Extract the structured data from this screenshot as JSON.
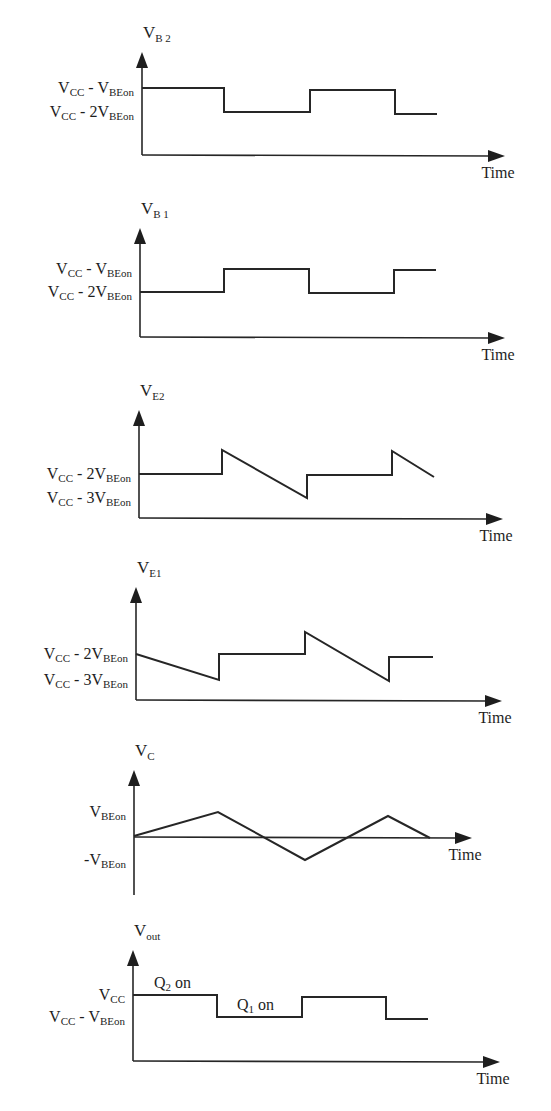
{
  "figure": {
    "background": "#ffffff",
    "ink": "#262626",
    "time_label": "Time"
  },
  "chart_data": {
    "type": "line",
    "panels": [
      {
        "id": "vb2",
        "title": {
          "main": "V",
          "sub": "B 2"
        },
        "xlabel": "Time",
        "y_ticks": [
          {
            "main": "V",
            "sub1": "CC",
            "mid": " - V",
            "sub2": "BEon",
            "y": 88
          },
          {
            "main": "V",
            "sub1": "CC",
            "mid": " - 2V",
            "sub2": "BEon",
            "y": 112
          }
        ],
        "axis": {
          "x0": 142,
          "ytop": 52,
          "ybase": 155,
          "xend": 505
        },
        "points": [
          [
            142,
            88
          ],
          [
            224,
            88
          ],
          [
            224,
            112
          ],
          [
            310,
            112
          ],
          [
            310,
            90
          ],
          [
            395,
            90
          ],
          [
            395,
            114
          ],
          [
            437,
            114
          ]
        ]
      },
      {
        "id": "vb1",
        "title": {
          "main": "V",
          "sub": "B 1"
        },
        "xlabel": "Time",
        "y_ticks": [
          {
            "main": "V",
            "sub1": "CC",
            "mid": " - V",
            "sub2": "BEon",
            "y": 269
          },
          {
            "main": "V",
            "sub1": "CC",
            "mid": " - 2V",
            "sub2": "BEon",
            "y": 292
          }
        ],
        "axis": {
          "x0": 140,
          "ytop": 228,
          "ybase": 337,
          "xend": 505
        },
        "points": [
          [
            140,
            292
          ],
          [
            224,
            292
          ],
          [
            224,
            269
          ],
          [
            309,
            269
          ],
          [
            309,
            293
          ],
          [
            394,
            293
          ],
          [
            394,
            270
          ],
          [
            436,
            270
          ]
        ]
      },
      {
        "id": "ve2",
        "title": {
          "main": "V",
          "sub": "E2"
        },
        "xlabel": "Time",
        "y_ticks": [
          {
            "main": "V",
            "sub1": "CC",
            "mid": " - 2V",
            "sub2": "BEon",
            "y": 474
          },
          {
            "main": "V",
            "sub1": "CC",
            "mid": " - 3V",
            "sub2": "BEon",
            "y": 498
          }
        ],
        "axis": {
          "x0": 139,
          "ytop": 410,
          "ybase": 518,
          "xend": 503
        },
        "points": [
          [
            139,
            474
          ],
          [
            222,
            474
          ],
          [
            222,
            450
          ],
          [
            307,
            498
          ],
          [
            307,
            475
          ],
          [
            392,
            475
          ],
          [
            392,
            451
          ],
          [
            434,
            477
          ]
        ]
      },
      {
        "id": "ve1",
        "title": {
          "main": "V",
          "sub": "E1"
        },
        "xlabel": "Time",
        "y_ticks": [
          {
            "main": "V",
            "sub1": "CC",
            "mid": " - 2V",
            "sub2": "BEon",
            "y": 654
          },
          {
            "main": "V",
            "sub1": "CC",
            "mid": " - 3V",
            "sub2": "BEon",
            "y": 680
          }
        ],
        "axis": {
          "x0": 136,
          "ytop": 587,
          "ybase": 700,
          "xend": 502
        },
        "points": [
          [
            136,
            654
          ],
          [
            219,
            680
          ],
          [
            219,
            654
          ],
          [
            305,
            654
          ],
          [
            305,
            632
          ],
          [
            389,
            681
          ],
          [
            389,
            657
          ],
          [
            433,
            657
          ]
        ]
      },
      {
        "id": "vc",
        "title": {
          "main": "V",
          "sub": "C"
        },
        "xlabel": "Time",
        "y_ticks": [
          {
            "main": "V",
            "sub1": "",
            "mid": "",
            "sub2": "BEon",
            "y": 812
          },
          {
            "main": "-V",
            "sub1": "",
            "mid": "",
            "sub2": "BEon",
            "y": 860
          }
        ],
        "axis": {
          "x0": 134,
          "ytop": 770,
          "ybase": 837,
          "ybottom": 895,
          "xend": 472
        },
        "points": [
          [
            134,
            836
          ],
          [
            218,
            812
          ],
          [
            305,
            860
          ],
          [
            388,
            816
          ],
          [
            430,
            838
          ]
        ]
      },
      {
        "id": "vout",
        "title": {
          "main": "V",
          "sub": "out"
        },
        "xlabel": "Time",
        "y_ticks": [
          {
            "main": "V",
            "sub1": "CC",
            "mid": "",
            "sub2": "",
            "y": 995
          },
          {
            "main": "V",
            "sub1": "CC",
            "mid": " - V",
            "sub2": "BEon",
            "y": 1017
          }
        ],
        "axis": {
          "x0": 133,
          "ytop": 950,
          "ybase": 1061,
          "xend": 500
        },
        "points": [
          [
            133,
            995
          ],
          [
            217,
            995
          ],
          [
            217,
            1017
          ],
          [
            302,
            1017
          ],
          [
            302,
            997
          ],
          [
            386,
            997
          ],
          [
            386,
            1019
          ],
          [
            428,
            1019
          ]
        ],
        "annotations": [
          {
            "main": "Q",
            "sub": "2",
            "rest": " on",
            "x": 154,
            "y": 988
          },
          {
            "main": "Q",
            "sub": "1",
            "rest": " on",
            "x": 237,
            "y": 1010
          }
        ]
      }
    ]
  }
}
